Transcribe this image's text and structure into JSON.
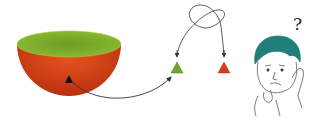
{
  "diagram": {
    "colors": {
      "bowl_top": "#7fae2a",
      "bowl_body": "#d9401a",
      "bowl_body_dark": "#b8300e",
      "marker": "#111111",
      "triangle_green": "#6fa52a",
      "triangle_red": "#d84018",
      "hair": "#1f7f7a",
      "line": "#333333"
    },
    "person": {
      "question_mark": "?"
    }
  }
}
